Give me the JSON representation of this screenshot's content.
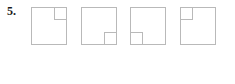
{
  "question": {
    "number_label": "5.",
    "figure_count": 4
  },
  "style": {
    "background_color": "#ffffff",
    "line_color": "#b9b9b9",
    "fill_color": "#ffffff",
    "label_color": "#1a1a1a"
  },
  "figures": [
    {
      "name": "figure-1",
      "order": 1,
      "outer_square": {
        "x": 0.5,
        "y": 0.5,
        "width": 35,
        "height": 37
      },
      "inner_square": {
        "corner": "top-right",
        "x": 23.5,
        "y": 0.5,
        "width": 12,
        "height": 12
      }
    },
    {
      "name": "figure-2",
      "order": 2,
      "outer_square": {
        "x": 0.5,
        "y": 0.5,
        "width": 35,
        "height": 37
      },
      "inner_square": {
        "corner": "bottom-right",
        "x": 23.5,
        "y": 25.5,
        "width": 12,
        "height": 12
      }
    },
    {
      "name": "figure-3",
      "order": 3,
      "outer_square": {
        "x": 0.5,
        "y": 0.5,
        "width": 35,
        "height": 37
      },
      "inner_square": {
        "corner": "bottom-left",
        "x": 0.5,
        "y": 25.5,
        "width": 12,
        "height": 12
      }
    },
    {
      "name": "figure-4",
      "order": 4,
      "outer_square": {
        "x": 0.5,
        "y": 0.5,
        "width": 35,
        "height": 37
      },
      "inner_square": {
        "corner": "top-left",
        "x": 0.5,
        "y": 0.5,
        "width": 12,
        "height": 12
      }
    }
  ]
}
